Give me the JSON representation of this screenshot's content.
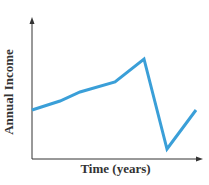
{
  "chart_data": {
    "type": "line",
    "title": "",
    "xlabel": "Time (years)",
    "ylabel": "Annual Income",
    "grid": false,
    "legend": null,
    "ticks": "none",
    "series": [
      {
        "name": "Annual Income",
        "color": "#3a9fd8",
        "points_px": [
          [
            32,
            110
          ],
          [
            60,
            101
          ],
          [
            80,
            92
          ],
          [
            115,
            82
          ],
          [
            144,
            59
          ],
          [
            167,
            149
          ],
          [
            196,
            110
          ]
        ],
        "relative_values": [
          0.35,
          0.41,
          0.47,
          0.54,
          0.7,
          0.07,
          0.35
        ]
      }
    ]
  },
  "colors": {
    "line": "#3a9fd8",
    "axis": "#333333"
  }
}
